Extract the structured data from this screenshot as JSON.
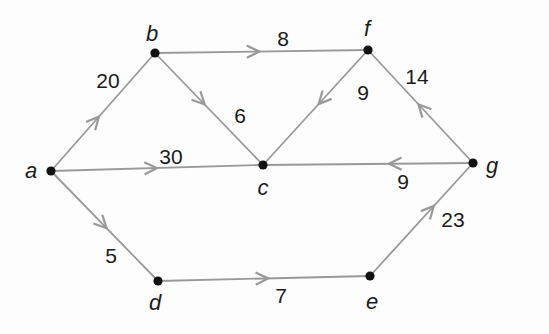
{
  "figure": {
    "kind": "directed-weighted-graph",
    "background_color": "#fdfdfd",
    "edge_color": "#999999",
    "node_color": "#121212",
    "text_color": "#1a1a1a",
    "edge_stroke_width": 1.8,
    "arrow_stroke_width": 2.2,
    "arrow_length": 14,
    "arrow_angle_deg": 26,
    "node_radius": 4.6
  },
  "graph": {
    "nodes": [
      {
        "id": "a",
        "label": "a",
        "x": 51,
        "y": 171,
        "lx": 31,
        "ly": 170
      },
      {
        "id": "b",
        "label": "b",
        "x": 155,
        "y": 53,
        "lx": 152,
        "ly": 33
      },
      {
        "id": "c",
        "label": "c",
        "x": 263,
        "y": 165,
        "lx": 263,
        "ly": 187
      },
      {
        "id": "d",
        "label": "d",
        "x": 158,
        "y": 281,
        "lx": 155,
        "ly": 302
      },
      {
        "id": "e",
        "label": "e",
        "x": 370,
        "y": 276,
        "lx": 372,
        "ly": 301
      },
      {
        "id": "f",
        "label": "f",
        "x": 368,
        "y": 50,
        "lx": 367,
        "ly": 28
      },
      {
        "id": "g",
        "label": "g",
        "x": 473,
        "y": 163,
        "lx": 492,
        "ly": 165
      }
    ],
    "edges": [
      {
        "from": "a",
        "to": "b",
        "weight": "20",
        "t": 0.46,
        "wx": 108,
        "wy": 80
      },
      {
        "from": "b",
        "to": "f",
        "weight": "8",
        "t": 0.49,
        "wx": 283,
        "wy": 38
      },
      {
        "from": "b",
        "to": "c",
        "weight": "6",
        "t": 0.46,
        "wx": 240,
        "wy": 115
      },
      {
        "from": "f",
        "to": "c",
        "weight": "9",
        "t": 0.47,
        "wx": 363,
        "wy": 92
      },
      {
        "from": "g",
        "to": "f",
        "weight": "14",
        "t": 0.52,
        "wx": 417,
        "wy": 76
      },
      {
        "from": "a",
        "to": "c",
        "weight": "30",
        "t": 0.5,
        "wx": 171,
        "wy": 156
      },
      {
        "from": "g",
        "to": "c",
        "weight": "9",
        "t": 0.4,
        "wx": 403,
        "wy": 181
      },
      {
        "from": "a",
        "to": "d",
        "weight": "5",
        "t": 0.52,
        "wx": 111,
        "wy": 255
      },
      {
        "from": "d",
        "to": "e",
        "weight": "7",
        "t": 0.52,
        "wx": 281,
        "wy": 295
      },
      {
        "from": "e",
        "to": "g",
        "weight": "23",
        "t": 0.62,
        "wx": 453,
        "wy": 219
      }
    ]
  }
}
